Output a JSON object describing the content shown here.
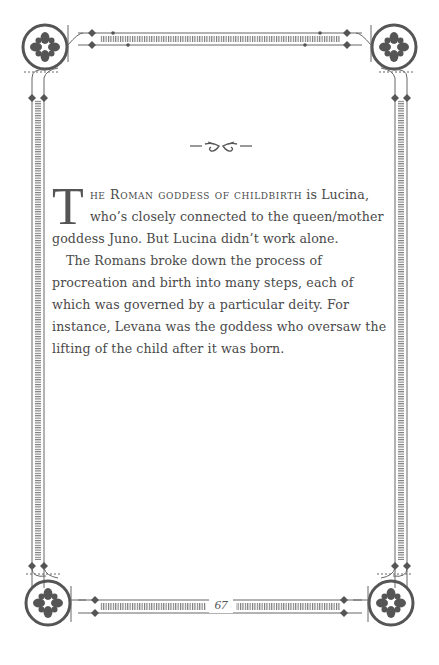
{
  "page": {
    "number": "67",
    "ornament_icon": "fleuron-divider-icon",
    "corner_icon": "flourish-rosette-icon",
    "frame_color": "#666666",
    "text_color": "#4a4a4a"
  },
  "body": {
    "paragraph1": {
      "drop_cap": "T",
      "small_caps": "he Roman goddess of childbirth",
      "rest": " is Lucina, who’s closely connected to the queen/mother goddess Juno. But Lucina didn’t work alone."
    },
    "paragraph2": "The Romans broke down the process of procreation and birth into many steps, each of which was governed by a particular deity. For instance, Levana was the goddess who oversaw the lifting of the child after it was born."
  }
}
